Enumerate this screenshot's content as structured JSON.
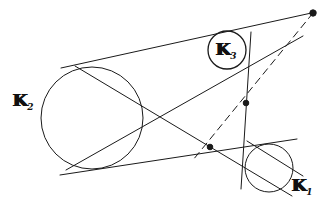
{
  "figure": {
    "background_color": "#ffffff",
    "stroke_color": "#1a1a1a",
    "width": 325,
    "height": 209,
    "labels": [
      {
        "id": "k2",
        "base": "K",
        "subscript": "2",
        "x": 13,
        "y": 92,
        "describes": "large-left-circle"
      },
      {
        "id": "k3",
        "base": "K",
        "subscript": "3",
        "x": 216,
        "y": 41,
        "describes": "small-upper-circle"
      },
      {
        "id": "k1",
        "base": "K",
        "subscript": "1",
        "x": 292,
        "y": 177,
        "describes": "small-lower-right-circle"
      }
    ],
    "circles": [
      {
        "id": "k2",
        "name": "circle-k2",
        "cx": 92,
        "cy": 118,
        "r": 51,
        "stroke_width": 1.0
      },
      {
        "id": "k3",
        "name": "circle-k3",
        "cx": 227,
        "cy": 50,
        "r": 19,
        "stroke_width": 1.3
      },
      {
        "id": "k1",
        "name": "circle-k1",
        "cx": 269,
        "cy": 168,
        "r": 24,
        "stroke_width": 1.0
      }
    ],
    "points": [
      {
        "id": "apex",
        "name": "apex-point",
        "x": 313,
        "y": 13,
        "r": 3.2,
        "filled": true
      },
      {
        "id": "center-cross",
        "name": "intersection-point-upper",
        "x": 246,
        "y": 103,
        "r": 2.8,
        "filled": true
      },
      {
        "id": "lower-cross",
        "name": "intersection-point-lower",
        "x": 210,
        "y": 147,
        "r": 2.8,
        "filled": true
      }
    ],
    "lines": [
      {
        "id": "tangent-upper-outer",
        "name": "tangent-line-upper-outer",
        "x1": 61,
        "y1": 68,
        "x2": 316,
        "y2": 12,
        "style": "solid",
        "stroke_width": 1.0
      },
      {
        "id": "tangent-lower-outer",
        "name": "tangent-line-lower-outer",
        "x1": 60,
        "y1": 175,
        "x2": 297,
        "y2": 139,
        "style": "solid",
        "stroke_width": 1.0
      },
      {
        "id": "tangent-cross-a",
        "name": "tangent-line-crossing-a",
        "x1": 66,
        "y1": 170,
        "x2": 303,
        "y2": 36,
        "style": "solid",
        "stroke_width": 1.0
      },
      {
        "id": "tangent-cross-b",
        "name": "tangent-line-crossing-b",
        "x1": 75,
        "y1": 66,
        "x2": 292,
        "y2": 196,
        "style": "solid",
        "stroke_width": 1.0
      },
      {
        "id": "tangent-k1-right",
        "name": "tangent-line-k1-right",
        "x1": 247,
        "y1": 141,
        "x2": 303,
        "y2": 176,
        "style": "solid",
        "stroke_width": 1.0
      },
      {
        "id": "vertical-axis",
        "name": "vertical-line-through-k3",
        "x1": 251,
        "y1": 32,
        "x2": 241,
        "y2": 189,
        "style": "solid",
        "stroke_width": 1.0
      },
      {
        "id": "dashed-apex",
        "name": "dashed-line-from-apex",
        "x1": 313,
        "y1": 13,
        "x2": 193,
        "y2": 160,
        "style": "dashed",
        "stroke_width": 1.0,
        "dash_pattern": "7 5"
      }
    ]
  }
}
